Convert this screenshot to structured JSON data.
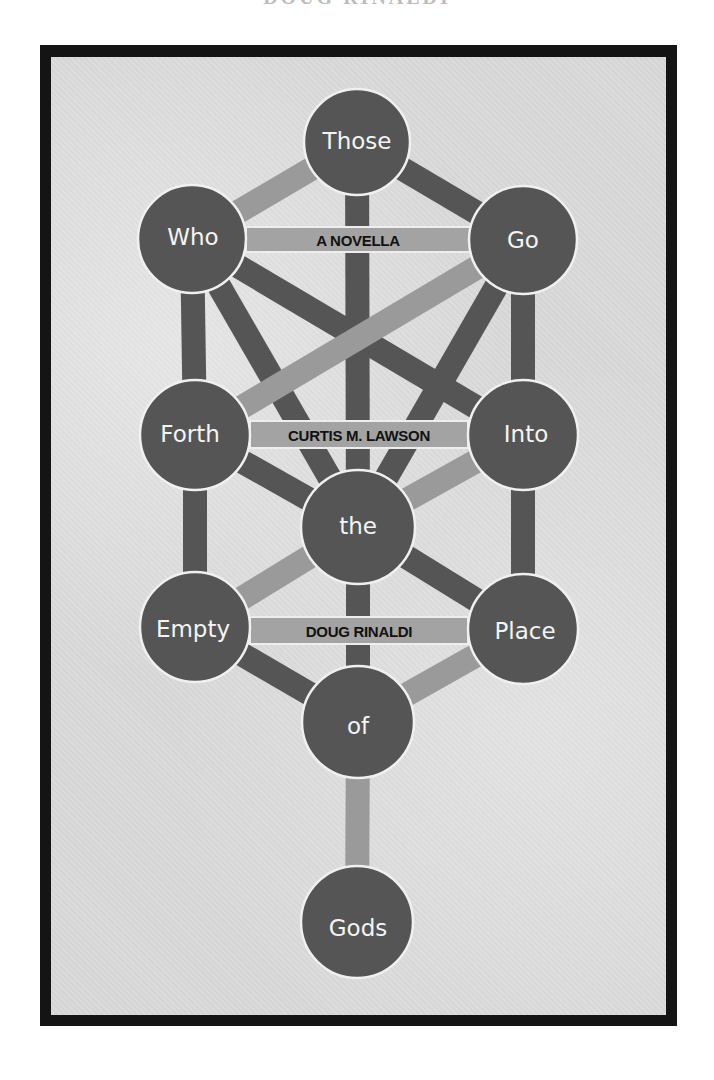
{
  "header": {
    "author_sliver": "DOUG RINALDI"
  },
  "cover": {
    "colors": {
      "frame": "#141414",
      "background": "#dadada",
      "node_fill": "#555555",
      "node_outline": "#f0f0f0",
      "path_dark": "#555555",
      "path_light": "#9a9a9a",
      "bar_fill": "#a3a3a3",
      "bar_text": "#111111",
      "node_text": "#f4f4f4"
    },
    "nodes": [
      {
        "id": "those",
        "label": "Those",
        "x": 357,
        "y": 142,
        "r": 53
      },
      {
        "id": "who",
        "label": "Who",
        "x": 192,
        "y": 239,
        "r": 54
      },
      {
        "id": "go",
        "label": "Go",
        "x": 523,
        "y": 240,
        "r": 54
      },
      {
        "id": "forth",
        "label": "Forth",
        "x": 195,
        "y": 435,
        "r": 55
      },
      {
        "id": "into",
        "label": "Into",
        "x": 523,
        "y": 435,
        "r": 55
      },
      {
        "id": "the",
        "label": "the",
        "x": 358,
        "y": 527,
        "r": 57
      },
      {
        "id": "empty",
        "label": "Empty",
        "x": 195,
        "y": 627,
        "r": 55
      },
      {
        "id": "place",
        "label": "Place",
        "x": 523,
        "y": 629,
        "r": 55
      },
      {
        "id": "of",
        "label": "of",
        "x": 358,
        "y": 722,
        "r": 56
      },
      {
        "id": "gods",
        "label": "Gods",
        "x": 357,
        "y": 922,
        "r": 56
      }
    ],
    "bars": [
      {
        "id": "subtitle",
        "label": "A NOVELLA",
        "y": 239
      },
      {
        "id": "author_1",
        "label": "CURTIS M. LAWSON",
        "y": 434
      },
      {
        "id": "author_2",
        "label": "DOUG RINALDI",
        "y": 630
      }
    ]
  }
}
